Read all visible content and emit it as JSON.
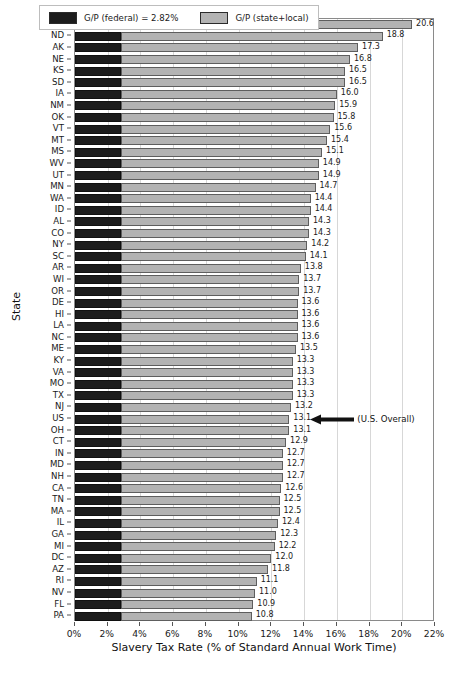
{
  "chart_data": {
    "type": "bar",
    "orientation": "horizontal",
    "stacked": true,
    "title": "",
    "xlabel": "Slavery Tax Rate (% of Standard Annual Work Time)",
    "ylabel": "State",
    "xlim": [
      0,
      22
    ],
    "xticks": [
      "0%",
      "2%",
      "4%",
      "6%",
      "8%",
      "10%",
      "12%",
      "14%",
      "16%",
      "18%",
      "20%",
      "22%"
    ],
    "xtick_values": [
      0,
      2,
      4,
      6,
      8,
      10,
      12,
      14,
      16,
      18,
      20,
      22
    ],
    "grid": true,
    "grid_axis": "x",
    "legend_position": "upper center",
    "federal_rate": 2.82,
    "series": [
      {
        "name": "G/P (federal) = 2.82%",
        "color": "#1c1c1c"
      },
      {
        "name": "G/P (state+local)",
        "color": "#b3b3b3"
      }
    ],
    "categories": [
      "WY",
      "ND",
      "AK",
      "NE",
      "KS",
      "SD",
      "IA",
      "NM",
      "OK",
      "VT",
      "MT",
      "MS",
      "WV",
      "UT",
      "MN",
      "WA",
      "ID",
      "AL",
      "CO",
      "NY",
      "SC",
      "AR",
      "WI",
      "OR",
      "DE",
      "HI",
      "LA",
      "NC",
      "ME",
      "KY",
      "VA",
      "MO",
      "TX",
      "NJ",
      "US",
      "OH",
      "CT",
      "IN",
      "MD",
      "NH",
      "CA",
      "TN",
      "MA",
      "IL",
      "GA",
      "MI",
      "DC",
      "AZ",
      "RI",
      "NV",
      "FL",
      "PA"
    ],
    "values": [
      20.6,
      18.8,
      17.3,
      16.8,
      16.5,
      16.5,
      16.0,
      15.9,
      15.8,
      15.6,
      15.4,
      15.1,
      14.9,
      14.9,
      14.7,
      14.4,
      14.4,
      14.3,
      14.3,
      14.2,
      14.1,
      13.8,
      13.7,
      13.7,
      13.6,
      13.6,
      13.6,
      13.6,
      13.5,
      13.3,
      13.3,
      13.3,
      13.3,
      13.2,
      13.1,
      13.1,
      12.9,
      12.7,
      12.7,
      12.7,
      12.6,
      12.5,
      12.5,
      12.4,
      12.3,
      12.2,
      12.0,
      11.8,
      11.1,
      11.0,
      10.9,
      10.8
    ],
    "data_labels": [
      "20.6",
      "18.8",
      "17.3",
      "16.8",
      "16.5",
      "16.5",
      "16.0",
      "15.9",
      "15.8",
      "15.6",
      "15.4",
      "15.1",
      "14.9",
      "14.9",
      "14.7",
      "14.4",
      "14.4",
      "14.3",
      "14.3",
      "14.2",
      "14.1",
      "13.8",
      "13.7",
      "13.7",
      "13.6",
      "13.6",
      "13.6",
      "13.6",
      "13.5",
      "13.3",
      "13.3",
      "13.3",
      "13.3",
      "13.2",
      "13.1",
      "13.1",
      "12.9",
      "12.7",
      "12.7",
      "12.7",
      "12.6",
      "12.5",
      "12.5",
      "12.4",
      "12.3",
      "12.2",
      "12.0",
      "11.8",
      "11.1",
      "11.0",
      "10.9",
      "10.8"
    ],
    "annotations": [
      {
        "text": "(U.S. Overall)",
        "target_category": "US",
        "target_value": 13.1,
        "arrow": "left"
      }
    ]
  }
}
